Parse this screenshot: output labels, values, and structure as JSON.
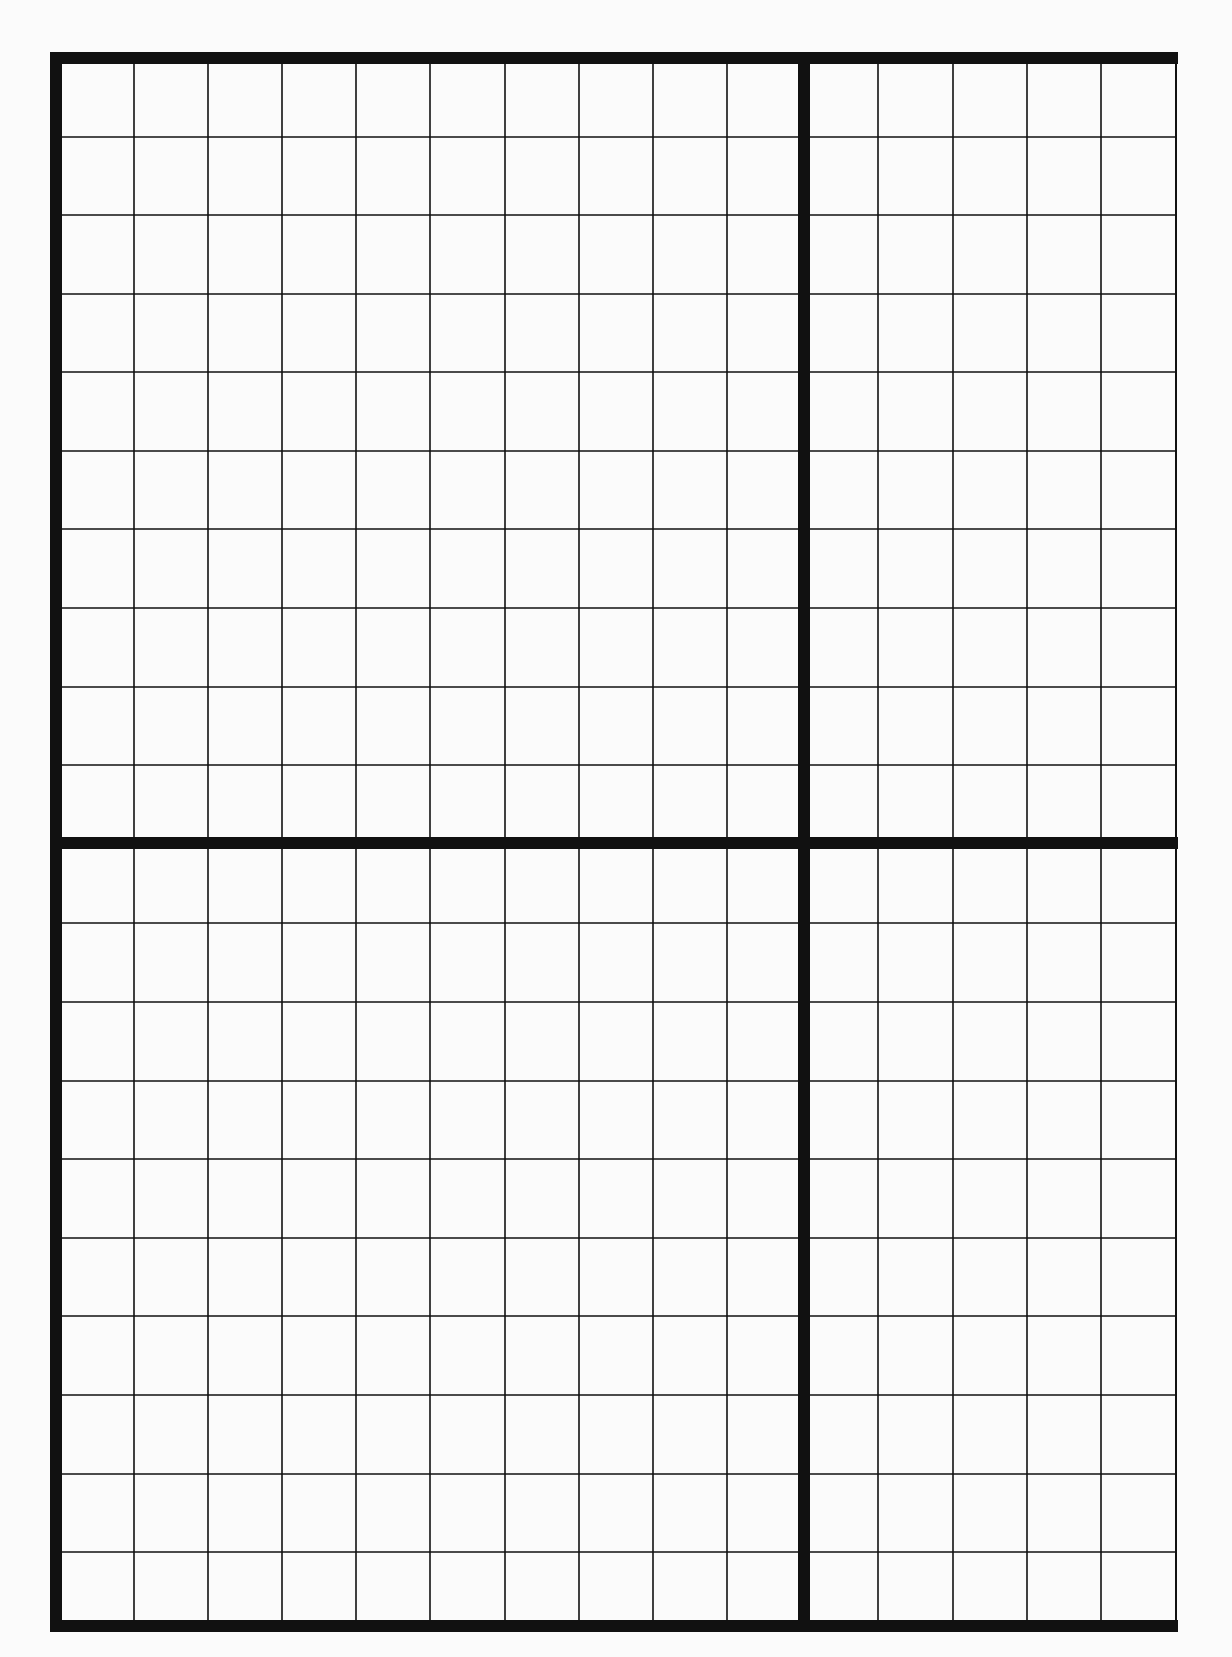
{
  "page": {
    "type": "blank grid sheet",
    "background_color": "#fbfbfb",
    "line_color": "#111111"
  },
  "grid": {
    "outer_border": {
      "left": 50,
      "top": 52,
      "right": 1178,
      "bottom": 1632,
      "thickness": 12
    },
    "thick_divider_vertical": {
      "x": 798,
      "thickness": 12
    },
    "thick_divider_horizontal": {
      "y": 837,
      "thickness": 12
    },
    "thin_line_width": 1.6,
    "thin_columns_x": [
      134,
      208,
      282,
      356,
      430,
      505,
      579,
      653,
      727,
      878,
      953,
      1027,
      1101
    ],
    "thin_rows_y": [
      137,
      215,
      294,
      372,
      451,
      529,
      608,
      687,
      765,
      923,
      1002,
      1081,
      1159,
      1238,
      1316,
      1395,
      1474,
      1552
    ],
    "columns_total": 15,
    "rows_total": 20,
    "quadrants": [
      {
        "name": "top-left",
        "columns": 10,
        "rows": 10
      },
      {
        "name": "top-right",
        "columns": 5,
        "rows": 10
      },
      {
        "name": "bottom-left",
        "columns": 10,
        "rows": 10
      },
      {
        "name": "bottom-right",
        "columns": 5,
        "rows": 10
      }
    ]
  }
}
